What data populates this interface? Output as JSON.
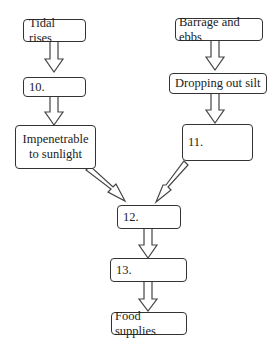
{
  "diagram": {
    "nodes": [
      {
        "id": "tidal-rises",
        "label": "Tidal rises"
      },
      {
        "id": "blank-10",
        "label": "10."
      },
      {
        "id": "impenetrable",
        "label": "Impenetrable to sunlight"
      },
      {
        "id": "barrage-ebbs",
        "label": "Barrage and ebbs"
      },
      {
        "id": "dropping-silt",
        "label": "Dropping out silt"
      },
      {
        "id": "blank-11",
        "label": "11."
      },
      {
        "id": "blank-12",
        "label": "12."
      },
      {
        "id": "blank-13",
        "label": "13."
      },
      {
        "id": "food-supplies",
        "label": "Food supplies"
      }
    ],
    "edges": [
      [
        "tidal-rises",
        "blank-10"
      ],
      [
        "blank-10",
        "impenetrable"
      ],
      [
        "barrage-ebbs",
        "dropping-silt"
      ],
      [
        "dropping-silt",
        "blank-11"
      ],
      [
        "impenetrable",
        "blank-12"
      ],
      [
        "blank-11",
        "blank-12"
      ],
      [
        "blank-12",
        "blank-13"
      ],
      [
        "blank-13",
        "food-supplies"
      ]
    ]
  }
}
